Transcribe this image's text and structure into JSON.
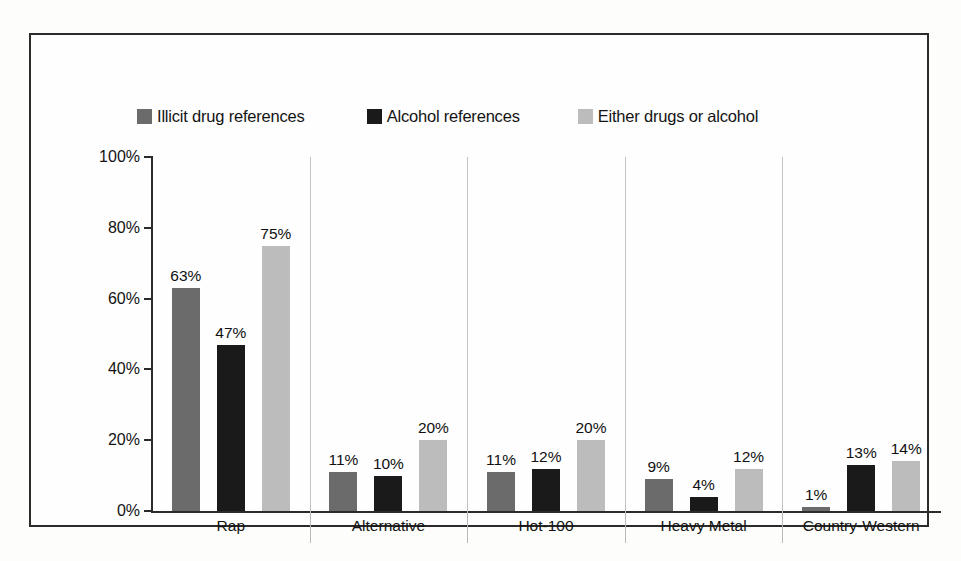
{
  "chart_data": {
    "type": "bar",
    "title": "",
    "subtitle": "",
    "xlabel": "",
    "ylabel": "",
    "ylim": [
      0,
      100
    ],
    "yticks": [
      "0%",
      "20%",
      "40%",
      "60%",
      "80%",
      "100%"
    ],
    "ytick_values": [
      0,
      20,
      40,
      60,
      80,
      100
    ],
    "grid": false,
    "legend_position": "top",
    "categories": [
      "Rap",
      "Alternative",
      "Hot-100",
      "Heavy Metal",
      "Country-Western"
    ],
    "series": [
      {
        "name": "Illicit drug references",
        "color": "#6b6b6b",
        "values": [
          63,
          11,
          11,
          9,
          1
        ],
        "labels": [
          "63%",
          "11%",
          "11%",
          "9%",
          "1%"
        ]
      },
      {
        "name": "Alcohol references",
        "color": "#1a1a1a",
        "values": [
          47,
          10,
          12,
          4,
          13
        ],
        "labels": [
          "47%",
          "10%",
          "12%",
          "4%",
          "13%"
        ]
      },
      {
        "name": "Either drugs or alcohol",
        "color": "#bcbcbc",
        "values": [
          75,
          20,
          20,
          12,
          14
        ],
        "labels": [
          "75%",
          "20%",
          "20%",
          "12%",
          "14%"
        ]
      }
    ]
  },
  "legend": {
    "items": [
      {
        "label": "Illicit drug references",
        "color": "#6b6b6b"
      },
      {
        "label": "Alcohol references",
        "color": "#1a1a1a"
      },
      {
        "label": "Either drugs or alcohol",
        "color": "#bcbcbc"
      }
    ]
  },
  "axis": {
    "y_labels": [
      "100%",
      "80%",
      "60%",
      "40%",
      "20%",
      "0%"
    ],
    "x_labels": [
      "Rap",
      "Alternative",
      "Hot-100",
      "Heavy Metal",
      "Country-Western"
    ]
  },
  "colors": {
    "frame": "#2b2b2b",
    "axis": "#2b2b2b",
    "separator": "#c3c3c3",
    "background": "#fefefe"
  }
}
